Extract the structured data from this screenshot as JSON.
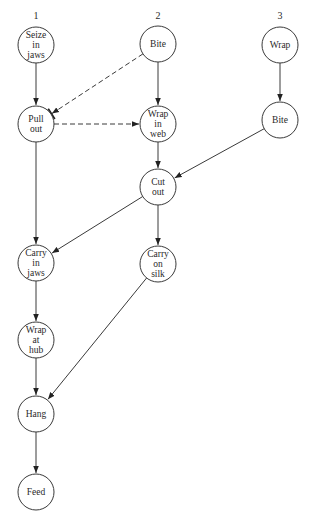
{
  "diagram": {
    "type": "flow-graph",
    "columns": [
      {
        "id": "1",
        "label": "1",
        "x": 36,
        "y": 19
      },
      {
        "id": "2",
        "label": "2",
        "x": 158,
        "y": 19
      },
      {
        "id": "3",
        "label": "3",
        "x": 280,
        "y": 19
      }
    ],
    "nodes": [
      {
        "id": "seize",
        "lines": [
          "Seize",
          "in",
          "jaws"
        ],
        "x": 36,
        "y": 45
      },
      {
        "id": "pull",
        "lines": [
          "Pull",
          "out"
        ],
        "x": 36,
        "y": 124
      },
      {
        "id": "bite2",
        "lines": [
          "Bite"
        ],
        "x": 158,
        "y": 44
      },
      {
        "id": "wrapweb",
        "lines": [
          "Wrap",
          "in",
          "web"
        ],
        "x": 158,
        "y": 124
      },
      {
        "id": "wrap3",
        "lines": [
          "Wrap"
        ],
        "x": 280,
        "y": 45
      },
      {
        "id": "bite3",
        "lines": [
          "Bite"
        ],
        "x": 280,
        "y": 120
      },
      {
        "id": "cut",
        "lines": [
          "Cut",
          "out"
        ],
        "x": 158,
        "y": 187
      },
      {
        "id": "carryjaws",
        "lines": [
          "Carry",
          "in",
          "jaws"
        ],
        "x": 36,
        "y": 263
      },
      {
        "id": "carrysilk",
        "lines": [
          "Carry",
          "on",
          "silk"
        ],
        "x": 158,
        "y": 264
      },
      {
        "id": "wraphub",
        "lines": [
          "Wrap",
          "at",
          "hub"
        ],
        "x": 36,
        "y": 340
      },
      {
        "id": "hang",
        "lines": [
          "Hang"
        ],
        "x": 36,
        "y": 414
      },
      {
        "id": "feed",
        "lines": [
          "Feed"
        ],
        "x": 36,
        "y": 492
      }
    ],
    "edges": [
      {
        "from": "seize",
        "to": "pull",
        "style": "solid"
      },
      {
        "from": "bite2",
        "to": "pull",
        "style": "dashed",
        "marker": "inhibit"
      },
      {
        "from": "pull",
        "to": "wrapweb",
        "style": "dashed"
      },
      {
        "from": "bite2",
        "to": "wrapweb",
        "style": "solid"
      },
      {
        "from": "wrap3",
        "to": "bite3",
        "style": "solid"
      },
      {
        "from": "wrapweb",
        "to": "cut",
        "style": "solid"
      },
      {
        "from": "bite3",
        "to": "cut",
        "style": "solid"
      },
      {
        "from": "pull",
        "to": "carryjaws",
        "style": "solid"
      },
      {
        "from": "cut",
        "to": "carryjaws",
        "style": "solid"
      },
      {
        "from": "cut",
        "to": "carrysilk",
        "style": "solid"
      },
      {
        "from": "carryjaws",
        "to": "wraphub",
        "style": "solid"
      },
      {
        "from": "wraphub",
        "to": "hang",
        "style": "solid"
      },
      {
        "from": "carrysilk",
        "to": "hang",
        "style": "solid"
      },
      {
        "from": "hang",
        "to": "feed",
        "style": "solid"
      }
    ],
    "node_radius": 18,
    "colors": {
      "stroke": "#3a3a3a",
      "text": "#2a2a2a",
      "background": "#ffffff"
    }
  }
}
